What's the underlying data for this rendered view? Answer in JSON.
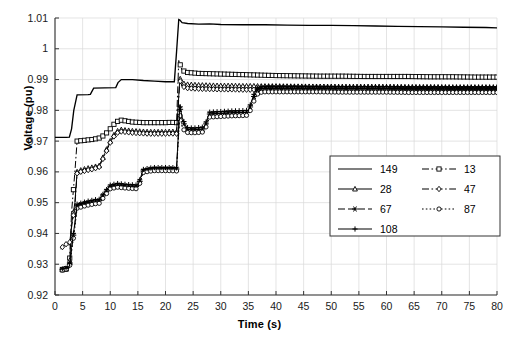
{
  "chart_data": {
    "type": "line",
    "title": "",
    "xlabel": "Time (s)",
    "ylabel": "Voltage (pu)",
    "xlim": [
      0,
      80
    ],
    "ylim": [
      0.92,
      1.01
    ],
    "grid": true,
    "legend_position": "center-right",
    "xticks": [
      "0",
      "5",
      "10",
      "15",
      "20",
      "25",
      "30",
      "35",
      "40",
      "45",
      "50",
      "55",
      "60",
      "65",
      "70",
      "75",
      "80"
    ],
    "yticks": [
      "0.92",
      "0.93",
      "0.94",
      "0.95",
      "0.96",
      "0.97",
      "0.98",
      "0.99",
      "1",
      "1.01"
    ],
    "series": [
      {
        "name": "149",
        "style": "solid",
        "marker": "none",
        "x": [
          0,
          1,
          1.6,
          2,
          2.6,
          3,
          3.4,
          4,
          6,
          6.4,
          7,
          9,
          11,
          11.4,
          12,
          14,
          16,
          18,
          20,
          21.6,
          22,
          22.4,
          22.6,
          23,
          24,
          26,
          28,
          30,
          34,
          38,
          42,
          46,
          50,
          54,
          58,
          62,
          66,
          70,
          74,
          78,
          80
        ],
        "y": [
          0.9712,
          0.9712,
          0.9712,
          0.9712,
          0.9713,
          0.974,
          0.98,
          0.985,
          0.9851,
          0.9852,
          0.9872,
          0.9873,
          0.9874,
          0.989,
          0.99,
          0.99,
          0.9897,
          0.9895,
          0.9893,
          0.9893,
          0.999,
          1.0095,
          1.0093,
          1.0085,
          1.0082,
          1.008,
          1.0081,
          1.0079,
          1.0078,
          1.0078,
          1.0077,
          1.0076,
          1.0076,
          1.0075,
          1.0074,
          1.0073,
          1.0072,
          1.0071,
          1.007,
          1.0069,
          1.0068
        ]
      },
      {
        "name": "13",
        "style": "dashdot",
        "marker": "square",
        "x": [
          1,
          1.6,
          2,
          2.6,
          3,
          3.6,
          4,
          4.6,
          5,
          5.6,
          6,
          6.6,
          7,
          8,
          9,
          10,
          11,
          11.6,
          12,
          13,
          14,
          15,
          16,
          17,
          18,
          19,
          20,
          21,
          22,
          22.4,
          23,
          24,
          26,
          28,
          30,
          32,
          34,
          36,
          38,
          40,
          44,
          48,
          52,
          56,
          60,
          64,
          68,
          72,
          76,
          80
        ],
        "y": [
          0.9283,
          0.9283,
          0.9286,
          0.929,
          0.947,
          0.96,
          0.97,
          0.9701,
          0.9702,
          0.9703,
          0.9704,
          0.9705,
          0.9706,
          0.971,
          0.972,
          0.974,
          0.9762,
          0.9766,
          0.9768,
          0.9765,
          0.9762,
          0.9761,
          0.976,
          0.976,
          0.976,
          0.976,
          0.976,
          0.9761,
          0.976,
          0.9962,
          0.993,
          0.9923,
          0.992,
          0.9919,
          0.9918,
          0.9917,
          0.9916,
          0.9915,
          0.9914,
          0.9913,
          0.9912,
          0.9911,
          0.9911,
          0.991,
          0.991,
          0.991,
          0.9909,
          0.9909,
          0.9908,
          0.9908
        ]
      },
      {
        "name": "28",
        "style": "solid",
        "marker": "triangle",
        "x": [
          1,
          1.6,
          2,
          2.6,
          3,
          3.6,
          4,
          4.6,
          5,
          5.6,
          6,
          6.6,
          7,
          8,
          9,
          10,
          11,
          11.6,
          12,
          13,
          14,
          15,
          16,
          17,
          18,
          19,
          20,
          21,
          22,
          22.6,
          23,
          24,
          26,
          28,
          30,
          32,
          34,
          36,
          38,
          40,
          44,
          48,
          52,
          56,
          60,
          64,
          68,
          72,
          76,
          80
        ],
        "y": [
          0.9282,
          0.9282,
          0.9284,
          0.9288,
          0.943,
          0.95,
          0.96,
          0.9605,
          0.9608,
          0.961,
          0.9612,
          0.9614,
          0.9616,
          0.962,
          0.966,
          0.97,
          0.973,
          0.9735,
          0.9737,
          0.9735,
          0.9733,
          0.9732,
          0.9731,
          0.973,
          0.973,
          0.973,
          0.973,
          0.9731,
          0.973,
          0.9905,
          0.9888,
          0.9884,
          0.9882,
          0.9881,
          0.988,
          0.988,
          0.9879,
          0.9879,
          0.9878,
          0.9878,
          0.9877,
          0.9877,
          0.9876,
          0.9876,
          0.9876,
          0.9875,
          0.9875,
          0.9874,
          0.9874,
          0.9874
        ]
      },
      {
        "name": "47",
        "style": "dashdot",
        "marker": "diamond",
        "x": [
          1,
          1.6,
          2,
          2.6,
          3,
          3.6,
          4,
          4.6,
          5,
          5.6,
          6,
          6.6,
          7,
          8,
          9,
          10,
          11,
          11.6,
          12,
          13,
          14,
          15,
          16,
          17,
          18,
          19,
          20,
          21,
          22,
          22.6,
          23,
          24,
          26,
          28,
          30,
          32,
          34,
          36,
          38,
          40,
          44,
          48,
          52,
          56,
          60,
          64,
          68,
          72,
          76,
          80
        ],
        "y": [
          0.935,
          0.936,
          0.9365,
          0.9362,
          0.942,
          0.949,
          0.9595,
          0.96,
          0.9602,
          0.9604,
          0.9606,
          0.9608,
          0.961,
          0.9616,
          0.9655,
          0.9695,
          0.9725,
          0.9729,
          0.9731,
          0.9729,
          0.9727,
          0.9726,
          0.9725,
          0.9724,
          0.9724,
          0.9724,
          0.9724,
          0.9725,
          0.9724,
          0.9898,
          0.9878,
          0.9872,
          0.987,
          0.9869,
          0.9868,
          0.9868,
          0.9867,
          0.9867,
          0.9866,
          0.9866,
          0.9866,
          0.9865,
          0.9865,
          0.9865,
          0.9864,
          0.9864,
          0.9864,
          0.9863,
          0.9863,
          0.9863
        ]
      },
      {
        "name": "67",
        "style": "dashed",
        "marker": "star",
        "x": [
          1,
          1.6,
          2,
          2.6,
          3,
          3.6,
          4,
          4.6,
          5,
          5.6,
          6,
          6.6,
          7,
          8,
          9,
          10,
          11,
          11.6,
          12,
          13,
          14,
          15,
          16,
          17,
          18,
          19,
          20,
          21,
          22,
          22.6,
          23,
          23.6,
          24,
          25,
          26,
          27,
          28,
          30,
          32,
          34,
          35,
          36,
          36.6,
          37,
          38,
          40,
          44,
          48,
          52,
          56,
          60,
          64,
          68,
          72,
          76,
          80
        ],
        "y": [
          0.9282,
          0.9282,
          0.9285,
          0.929,
          0.935,
          0.943,
          0.949,
          0.9493,
          0.9496,
          0.9498,
          0.95,
          0.9502,
          0.9504,
          0.9506,
          0.953,
          0.9552,
          0.9556,
          0.9558,
          0.9556,
          0.9554,
          0.9553,
          0.9552,
          0.9603,
          0.9608,
          0.961,
          0.961,
          0.961,
          0.961,
          0.9609,
          0.981,
          0.977,
          0.9745,
          0.9738,
          0.9736,
          0.9738,
          0.974,
          0.9788,
          0.979,
          0.9792,
          0.9793,
          0.9794,
          0.9845,
          0.9866,
          0.987,
          0.9872,
          0.9872,
          0.9872,
          0.9872,
          0.9871,
          0.9871,
          0.9871,
          0.987,
          0.987,
          0.987,
          0.987,
          0.987
        ]
      },
      {
        "name": "87",
        "style": "dotted",
        "marker": "circle",
        "x": [
          1,
          1.6,
          2,
          2.6,
          3,
          3.6,
          4,
          4.6,
          5,
          5.6,
          6,
          6.6,
          7,
          8,
          9,
          10,
          11,
          11.6,
          12,
          13,
          14,
          15,
          16,
          17,
          18,
          19,
          20,
          21,
          22,
          22.6,
          23,
          23.6,
          24,
          25,
          26,
          27,
          28,
          30,
          32,
          34,
          35,
          36,
          36.6,
          37,
          38,
          40,
          44,
          48,
          52,
          56,
          60,
          64,
          68,
          72,
          76,
          80
        ],
        "y": [
          0.928,
          0.9281,
          0.9283,
          0.9288,
          0.934,
          0.942,
          0.9482,
          0.9485,
          0.9488,
          0.949,
          0.9492,
          0.9494,
          0.9496,
          0.9498,
          0.9522,
          0.9545,
          0.9549,
          0.9551,
          0.9549,
          0.9547,
          0.9546,
          0.9545,
          0.9598,
          0.9602,
          0.9604,
          0.9604,
          0.9604,
          0.9604,
          0.9603,
          0.979,
          0.9745,
          0.973,
          0.9728,
          0.9727,
          0.9728,
          0.973,
          0.9778,
          0.978,
          0.9782,
          0.9783,
          0.9784,
          0.983,
          0.9852,
          0.9858,
          0.986,
          0.986,
          0.986,
          0.986,
          0.9859,
          0.9859,
          0.9859,
          0.9858,
          0.9858,
          0.9858,
          0.9858,
          0.9858
        ]
      },
      {
        "name": "108",
        "style": "solid",
        "marker": "plus",
        "x": [
          1,
          1.6,
          2,
          2.6,
          3,
          3.6,
          4,
          4.6,
          5,
          5.6,
          6,
          6.6,
          7,
          8,
          9,
          10,
          11,
          11.6,
          12,
          13,
          14,
          15,
          16,
          17,
          18,
          19,
          20,
          21,
          22,
          22.6,
          23,
          23.6,
          24,
          25,
          26,
          27,
          28,
          30,
          32,
          34,
          35,
          36,
          36.6,
          37,
          38,
          40,
          44,
          48,
          52,
          56,
          60,
          64,
          68,
          72,
          76,
          80
        ],
        "y": [
          0.9284,
          0.9285,
          0.9287,
          0.9292,
          0.9355,
          0.9435,
          0.9495,
          0.9498,
          0.95,
          0.9503,
          0.9505,
          0.9507,
          0.9509,
          0.9511,
          0.9535,
          0.9557,
          0.9561,
          0.9563,
          0.9561,
          0.9559,
          0.9558,
          0.9557,
          0.9608,
          0.9612,
          0.9614,
          0.9614,
          0.9614,
          0.9614,
          0.9613,
          0.9818,
          0.9778,
          0.9752,
          0.9744,
          0.9742,
          0.9744,
          0.9746,
          0.9794,
          0.9796,
          0.9798,
          0.9799,
          0.98,
          0.9852,
          0.9872,
          0.9876,
          0.9878,
          0.9878,
          0.9878,
          0.9877,
          0.9877,
          0.9877,
          0.9877,
          0.9876,
          0.9876,
          0.9876,
          0.9876,
          0.9876
        ]
      }
    ],
    "legend": [
      {
        "label": "149",
        "style": "solid",
        "marker": "none"
      },
      {
        "label": "13",
        "style": "dashdot",
        "marker": "square"
      },
      {
        "label": "28",
        "style": "solid",
        "marker": "triangle"
      },
      {
        "label": "47",
        "style": "dashdot",
        "marker": "diamond"
      },
      {
        "label": "67",
        "style": "dashed",
        "marker": "star"
      },
      {
        "label": "87",
        "style": "dotted",
        "marker": "circle"
      },
      {
        "label": "108",
        "style": "solid",
        "marker": "plus"
      }
    ]
  },
  "colors": {
    "line": "#000000",
    "grid": "#d9d9d9",
    "axis": "#555555",
    "background": "#ffffff"
  }
}
